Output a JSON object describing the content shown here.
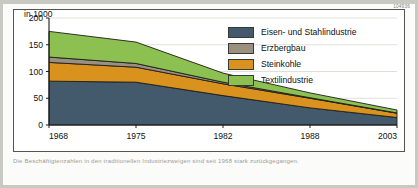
{
  "meta": {
    "unit_label": "in 1000",
    "serial_number": "104936",
    "caption": "Die Beschäftigtenzahlen in den traditionellen Industriezweigen sind seit 1968 stark zurückgegangen."
  },
  "legend": {
    "items": [
      {
        "label": "Eisen- und Stahlindustrie",
        "color": "#425a6b"
      },
      {
        "label": "Erzbergbau",
        "color": "#9b9080"
      },
      {
        "label": "Steinkohle",
        "color": "#d9921e"
      },
      {
        "label": "Textilindustrie",
        "color": "#8cc152"
      }
    ]
  },
  "chart_data": {
    "type": "area",
    "title": "",
    "subtitle": "",
    "xlabel": "",
    "ylabel": "in 1000",
    "x": [
      1968,
      1975,
      1982,
      1988,
      2003
    ],
    "xtick_labels": [
      "1968",
      "1975",
      "1982",
      "1988",
      "2003"
    ],
    "ytick_labels": [
      "0",
      "50",
      "100",
      "150",
      "200"
    ],
    "yticks": [
      0,
      50,
      100,
      150,
      200
    ],
    "ylim": [
      0,
      200
    ],
    "grid": true,
    "stacked": true,
    "legend_position": "inside-top-right",
    "series": [
      {
        "name": "Eisen- und Stahlindustrie",
        "color": "#425a6b",
        "values": [
          82,
          80,
          55,
          32,
          14
        ]
      },
      {
        "name": "Steinkohle",
        "color": "#d9921e",
        "values": [
          35,
          28,
          22,
          18,
          8
        ]
      },
      {
        "name": "Erzbergbau",
        "color": "#9b9080",
        "values": [
          10,
          7,
          3,
          1,
          0.5
        ]
      },
      {
        "name": "Textilindustrie",
        "color": "#8cc152",
        "values": [
          48,
          40,
          17,
          9,
          5.5
        ]
      }
    ],
    "stack_order_bottom_to_top": [
      "Eisen- und Stahlindustrie",
      "Steinkohle",
      "Erzbergbau",
      "Textilindustrie"
    ],
    "totals": [
      175,
      155,
      97,
      60,
      28
    ]
  }
}
